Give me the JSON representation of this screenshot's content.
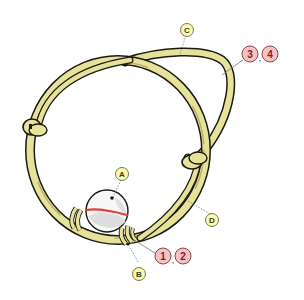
{
  "diagram": {
    "colors": {
      "cord_fill": "#e6e29a",
      "cord_outline": "#1a1a10",
      "cord_shadow": "#b8b070",
      "bead_fill": "#f7f7f7",
      "bead_shadow": "#d6d6d6",
      "bead_line": "#e0403a",
      "letter_badge_fill": "#fafab0",
      "letter_badge_stroke": "#6a6a3a",
      "number_badge_fill": "#f5c2c4",
      "number_badge_stroke": "#7a3a3c",
      "number_text": "#8a1a20",
      "leader_line": "#777777"
    },
    "labels": [
      {
        "id": "A",
        "text": "A",
        "type": "letter",
        "target": "bead"
      },
      {
        "id": "B",
        "text": "B",
        "type": "letter",
        "target": "wrapped binding"
      },
      {
        "id": "C",
        "text": "C",
        "type": "letter",
        "target": "upper cord"
      },
      {
        "id": "D",
        "text": "D",
        "type": "letter",
        "target": "lower right cord"
      }
    ],
    "number_groups": [
      {
        "items": [
          "1",
          "2"
        ],
        "separator": ","
      },
      {
        "items": [
          "3",
          "4"
        ],
        "separator": ","
      }
    ]
  }
}
